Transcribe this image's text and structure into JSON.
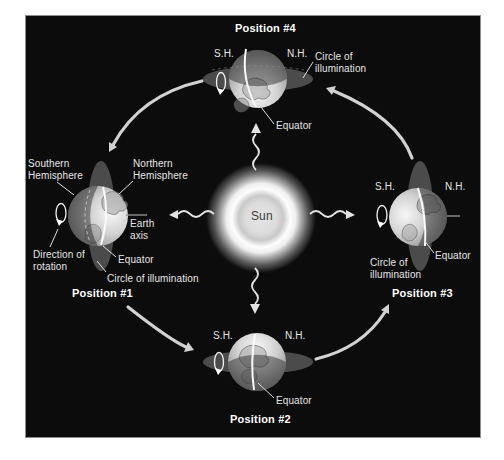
{
  "colors": {
    "panel_background": "#0c0c0c",
    "panel_border": "#8e8e8e",
    "label_text": "#e6e6e6",
    "title_text": "#ffffff",
    "orbit_arrow": "#d2d2d2",
    "sun_label_text": "#3c3c3c",
    "illumination_ellipse": "#4b4b4b"
  },
  "sun": {
    "label": "Sun"
  },
  "positions": {
    "p1": {
      "title": "Position #1",
      "southern_hemisphere": [
        "Southern",
        "Hemisphere"
      ],
      "northern_hemisphere": [
        "Northern",
        "Hemisphere"
      ],
      "earth_axis": [
        "Earth",
        "axis"
      ],
      "equator": "Equator",
      "circle_of_illumination": "Circle of illumination",
      "direction_of_rotation": [
        "Direction of",
        "rotation"
      ]
    },
    "p2": {
      "title": "Position #2",
      "sh": "S.H.",
      "nh": "N.H.",
      "equator": "Equator"
    },
    "p3": {
      "title": "Position #3",
      "sh": "S.H.",
      "nh": "N.H.",
      "equator": "Equator",
      "circle_of_illumination": [
        "Circle of",
        "illumination"
      ]
    },
    "p4": {
      "title": "Position #4",
      "sh": "S.H.",
      "nh": "N.H.",
      "equator": "Equator",
      "circle_of_illumination": [
        "Circle of",
        "illumination"
      ]
    }
  }
}
